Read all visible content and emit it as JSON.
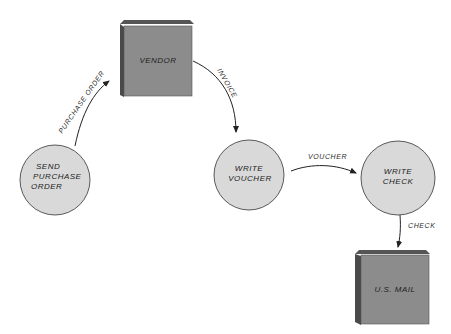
{
  "diagram": {
    "type": "data-flow",
    "colors": {
      "process_fill": "#d9d9d9",
      "entity_front": "#8c8c8c",
      "entity_top": "#555555",
      "entity_side": "#4a4a4a",
      "stroke": "#333333"
    },
    "external_entities": [
      {
        "id": "vendor",
        "label": "VENDOR"
      },
      {
        "id": "usmail",
        "label": "U.S. MAIL"
      }
    ],
    "processes": [
      {
        "id": "send_po",
        "lines": [
          "SEND",
          "PURCHASE",
          "ORDER"
        ]
      },
      {
        "id": "write_voucher",
        "lines": [
          "WRITE",
          "VOUCHER"
        ]
      },
      {
        "id": "write_check",
        "lines": [
          "WRITE",
          "CHECK"
        ]
      }
    ],
    "flows": [
      {
        "from": "send_po",
        "to": "vendor",
        "label": "PURCHASE ORDER"
      },
      {
        "from": "vendor",
        "to": "write_voucher",
        "label": "INVOICE"
      },
      {
        "from": "write_voucher",
        "to": "write_check",
        "label": "VOUCHER"
      },
      {
        "from": "write_check",
        "to": "usmail",
        "label": "CHECK"
      }
    ]
  }
}
